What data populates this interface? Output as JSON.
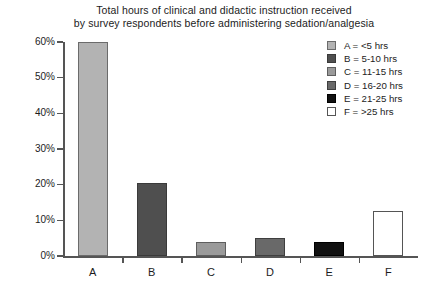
{
  "chart_data": {
    "type": "bar",
    "title": "Total hours of clinical and didactic instruction received by survey respondents before administering sedation/analgesia",
    "title_lines": [
      "Total hours of clinical and didactic instruction received",
      "by survey respondents before administering sedation/analgesia"
    ],
    "categories": [
      "A",
      "B",
      "C",
      "D",
      "E",
      "F"
    ],
    "values": [
      60,
      20.5,
      3.8,
      5,
      4,
      12.5
    ],
    "xlabel": "",
    "ylabel": "",
    "ylim": [
      0,
      60
    ],
    "ytick_labels": [
      "0%",
      "10%",
      "20%",
      "30%",
      "40%",
      "50%",
      "60%"
    ],
    "ytick_values": [
      0,
      10,
      20,
      30,
      40,
      50,
      60
    ],
    "grid": false,
    "legend_position": "top-right",
    "series": [
      {
        "name": "Percent of respondents",
        "values": [
          60,
          20.5,
          3.8,
          5,
          4,
          12.5
        ]
      }
    ],
    "bar_colors": [
      "#b3b3b3",
      "#4f4f4f",
      "#9a9a9a",
      "#696969",
      "#111111",
      "#ffffff"
    ],
    "bar_edge_colors": [
      "#6b6b6b",
      "#3a3a3a",
      "#5e5e5e",
      "#3f3f3f",
      "#000000",
      "#555555"
    ],
    "legend": [
      {
        "key": "A",
        "label": "A = <5 hrs",
        "swatch": "#b3b3b3",
        "edge": "#6b6b6b"
      },
      {
        "key": "B",
        "label": "B = 5-10 hrs",
        "swatch": "#4f4f4f",
        "edge": "#3a3a3a"
      },
      {
        "key": "C",
        "label": "C = 11-15 hrs",
        "swatch": "#9a9a9a",
        "edge": "#5e5e5e"
      },
      {
        "key": "D",
        "label": "D = 16-20 hrs",
        "swatch": "#696969",
        "edge": "#3f3f3f"
      },
      {
        "key": "E",
        "label": "E = 21-25 hrs",
        "swatch": "#111111",
        "edge": "#000000"
      },
      {
        "key": "F",
        "label": "F = >25 hrs",
        "swatch": "#ffffff",
        "edge": "#555555"
      }
    ]
  },
  "colors": {
    "axis": "#555555",
    "text": "#1c1c1c",
    "background": "#ffffff"
  }
}
